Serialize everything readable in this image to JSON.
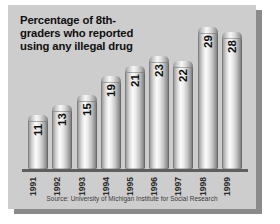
{
  "chart_data": {
    "type": "bar",
    "title_lines": [
      "Percentage of 8th-",
      "graders who reported",
      "using any illegal drug"
    ],
    "categories": [
      "1991",
      "1992",
      "1993",
      "1994",
      "1995",
      "1996",
      "1997",
      "1998",
      "1999"
    ],
    "values": [
      11,
      13,
      15,
      19,
      21,
      23,
      22,
      29,
      28
    ],
    "xlabel": "",
    "ylabel": "",
    "ylim": [
      0,
      31
    ],
    "grid": false,
    "legend": "none",
    "data_labels": true,
    "source": "Source: University of Michigan Institute for Social Research"
  },
  "colors": {
    "panel_background": "#cdcdcd",
    "page_background": "#ffffff",
    "panel_shadow": "#8a8a8a",
    "axis_line": "#5f5f5f",
    "title_text": "#101010",
    "value_text": "#0d0d0d",
    "tick_text": "#2a2a2a",
    "source_text": "#3a3a3a",
    "bar_highlight": "#fbfbfb",
    "bar_shade": "#6f6f6f"
  }
}
